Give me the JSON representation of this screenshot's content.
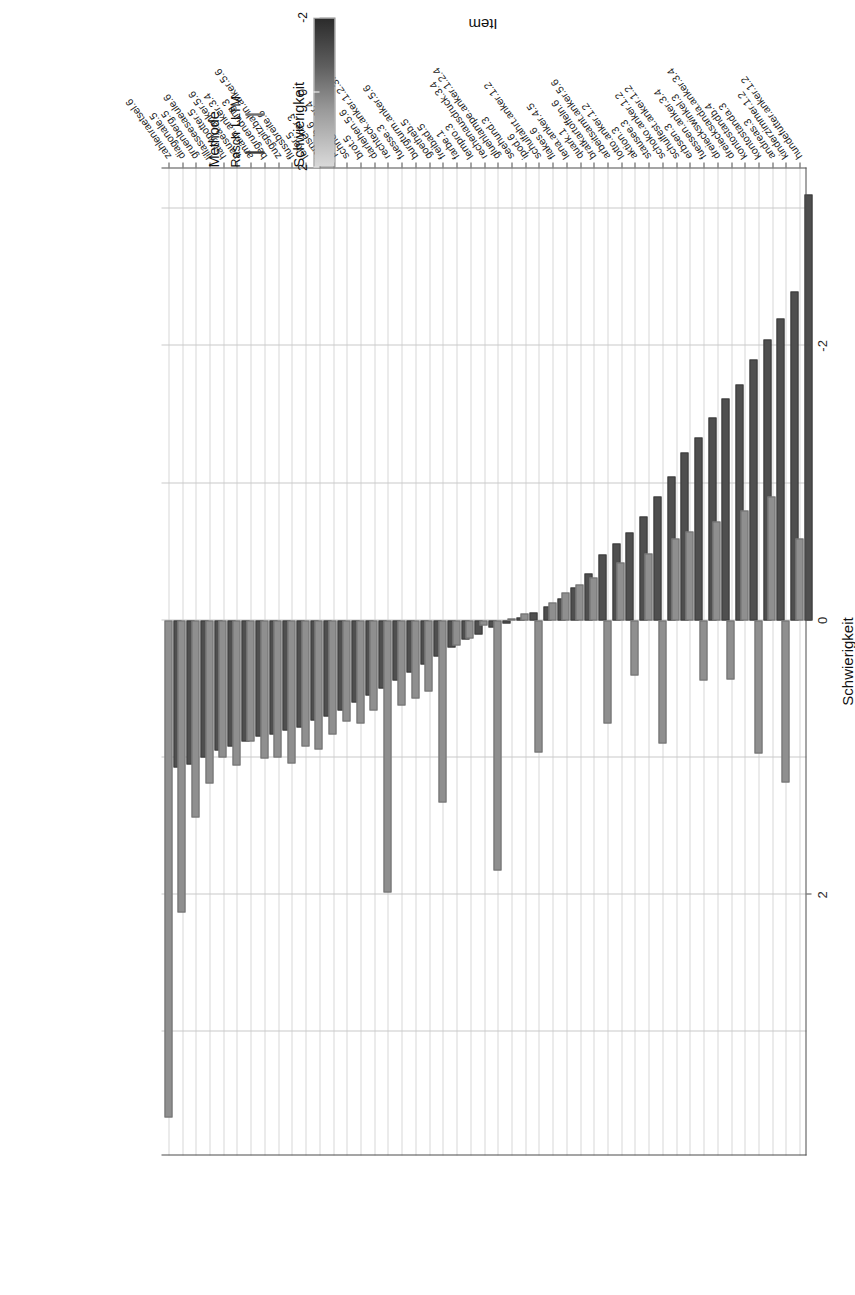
{
  "figure": {
    "axis_titles": {
      "x": "Schwierigkeit",
      "y": "Item"
    },
    "x_ticks": [
      "2",
      "0",
      "-2"
    ],
    "x_tick_values": [
      2,
      0,
      -2
    ],
    "x_range": [
      3.9,
      -3.3
    ]
  },
  "legend": {
    "method": {
      "title": "Methode",
      "entries": [
        {
          "label": "Rasch",
          "color": "#4f4f4f"
        },
        {
          "label": "LLTM",
          "color": "#8f8f8f"
        }
      ]
    },
    "difficulty": {
      "title": "Schwierigkeit",
      "ticks": [
        "2",
        "0",
        "-2"
      ],
      "tick_values": [
        2,
        0,
        -2
      ],
      "gradient_light": "#d9d9d9",
      "gradient_dark": "#2b2b2b"
    }
  },
  "chart_data": {
    "type": "bar",
    "title": "",
    "xlabel": "Schwierigkeit",
    "ylabel": "Item",
    "xlim": [
      3.9,
      -3.3
    ],
    "grid": true,
    "legend_position": "right",
    "orientation": "horizontal",
    "categories": [
      "zahlenraetsel.6",
      "diagonale.5",
      "gruenberg.5",
      "lillasseesaeule.6",
      "harrypotter.5",
      "pausea.anker.5.6",
      "amann.anker.3.4",
      "begruendung.3",
      "zugspitzbahn.anker.5.6",
      "flussbreite.6",
      "leiter.5",
      "fernseher.3",
      "pauseb.6",
      "schnellfahrer.4",
      "brot.5",
      "darlehen.5.6",
      "rechteck.anker.1.2.3.4",
      "fuesse.3",
      "burgturm.anker.5.6",
      "goetheb.5",
      "freibad.5",
      "farbe.1",
      "lempro.3",
      "rechenausdruck.3.4",
      "gluehlampe.anker.1.2.4",
      "seehund.3",
      "ipod.6",
      "schulfahrt.anker.1.2",
      "flakes.6",
      "lena.anker.4.5",
      "quark.1",
      "bratkartoffeln.6",
      "arbeitsamt.anker.5.6",
      "lotto.anker.1.2",
      "aktion.3",
      "stausee.3",
      "schoko.anker.1.2",
      "schulfest.anker.1.2",
      "erbsen.3",
      "fuessen.anker.3.4",
      "dreieckswinkel.3",
      "dreiecksanda.anker.3.4",
      "kontostandb.4",
      "kontostanda.3",
      "andreas.3",
      "kinderzimmer.1.2",
      "hundefutter.anker.1.2"
    ],
    "series": [
      {
        "name": "LLTM",
        "color": "#8f8f8f",
        "values": [
          3.62,
          2.13,
          1.44,
          1.19,
          1.0,
          1.06,
          0.88,
          1.01,
          1.0,
          1.04,
          0.92,
          0.94,
          0.83,
          0.74,
          0.75,
          0.66,
          1.98,
          0.62,
          0.57,
          0.52,
          1.33,
          0.18,
          0.13,
          0.04,
          1.82,
          -0.01,
          -0.05,
          0.96,
          -0.13,
          -0.2,
          -0.26,
          -0.31,
          0.75,
          -0.42,
          0.4,
          -0.49,
          0.9,
          -0.6,
          -0.65,
          0.44,
          -0.72,
          0.43,
          -0.8,
          0.97,
          -0.9,
          1.18,
          -0.6
        ]
      },
      {
        "name": "Rasch",
        "color": "#4f4f4f",
        "values": [
          1.07,
          1.05,
          1.0,
          0.95,
          0.92,
          0.88,
          0.85,
          0.83,
          0.8,
          0.78,
          0.73,
          0.7,
          0.66,
          0.6,
          0.55,
          0.5,
          0.44,
          0.38,
          0.32,
          0.26,
          0.2,
          0.14,
          0.1,
          0.05,
          0.02,
          -0.02,
          -0.06,
          -0.1,
          -0.16,
          -0.24,
          -0.34,
          -0.48,
          -0.56,
          -0.64,
          -0.76,
          -0.9,
          -1.05,
          -1.22,
          -1.33,
          -1.48,
          -1.62,
          -1.72,
          -1.9,
          -2.05,
          -2.2,
          -2.4,
          -3.1
        ]
      }
    ]
  }
}
